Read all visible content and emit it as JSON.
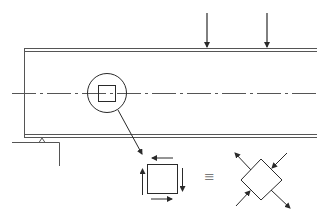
{
  "diagram": {
    "type": "beam-stress-element",
    "equivalence_symbol": "≡",
    "colors": {
      "line": "#2a2a2a",
      "beam_edge": "#555555",
      "symbol": "#7a7a7a",
      "background": "#ffffff"
    },
    "components": [
      {
        "name": "beam",
        "label": ""
      },
      {
        "name": "centerline",
        "label": ""
      },
      {
        "name": "load-arrow-1",
        "label": ""
      },
      {
        "name": "load-arrow-2",
        "label": ""
      },
      {
        "name": "pin-support",
        "label": ""
      },
      {
        "name": "detail-circle",
        "label": ""
      },
      {
        "name": "shear-stress-element",
        "label": ""
      },
      {
        "name": "principal-stress-element",
        "label": ""
      }
    ]
  }
}
